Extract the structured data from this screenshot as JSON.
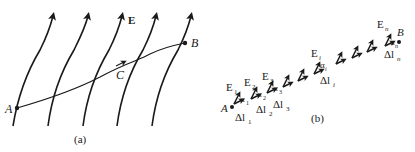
{
  "figure": {
    "panel_a": {
      "caption": "(a)",
      "field_label": "E",
      "point_start": "A",
      "point_mid": "C",
      "point_end": "B"
    },
    "panel_b": {
      "caption": "(b)",
      "point_start": "A",
      "point_end": "B",
      "field_labels": [
        "E",
        "E",
        "E",
        "E",
        "E"
      ],
      "field_subscripts": [
        "1",
        "2",
        "3",
        "i",
        "n"
      ],
      "angle_label": "α",
      "angle_subscripts": [
        "1",
        "2",
        "3",
        "i",
        "n"
      ],
      "segment_label": "Δl",
      "segment_subscripts": [
        "1",
        "2",
        "3",
        "i",
        "n"
      ]
    }
  },
  "colors": {
    "ink": "#1a1a1a",
    "background": "#ffffff"
  }
}
